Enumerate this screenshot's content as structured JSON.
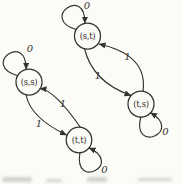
{
  "figure": {
    "type": "state-transition-diagram",
    "paper_color": "#fbfbf8",
    "ink_color": "#35322c",
    "smudge_color": "#b3b0aa",
    "states": [
      {
        "id": "st",
        "label": "(s,t)",
        "x": 87.5,
        "y": 36,
        "r": 13
      },
      {
        "id": "ss",
        "label": "(s,s)",
        "x": 29,
        "y": 82,
        "r": 13
      },
      {
        "id": "ts",
        "label": "(t,s)",
        "x": 141,
        "y": 104,
        "r": 13
      },
      {
        "id": "tt",
        "label": "(t,t)",
        "x": 79,
        "y": 140,
        "r": 12.8
      }
    ],
    "self_loops": [
      {
        "state": "st",
        "symbol": "0",
        "angle_deg": 234,
        "flip": false,
        "label_x": 87,
        "label_y": 9
      },
      {
        "state": "ss",
        "symbol": "0",
        "angle_deg": 233,
        "flip": false,
        "label_x": 30,
        "label_y": 52
      },
      {
        "state": "ts",
        "symbol": "0",
        "angle_deg": 67,
        "flip": true,
        "label_x": 165.5,
        "label_y": 135
      },
      {
        "state": "tt",
        "symbol": "0",
        "angle_deg": 62,
        "flip": true,
        "label_x": 104.5,
        "label_y": 172.5
      }
    ],
    "transitions": [
      {
        "from": "st",
        "to": "ts",
        "symbol": "1",
        "start": [
          84.5,
          48.5
        ],
        "control": [
          92.5,
          82
        ],
        "end": [
          131,
          95.5
        ],
        "label_x": 98,
        "label_y": 79
      },
      {
        "from": "ts",
        "to": "st",
        "symbol": "1",
        "start": [
          143,
          91
        ],
        "control": [
          148,
          55
        ],
        "end": [
          99,
          44
        ],
        "label_x": 127.5,
        "label_y": 60
      },
      {
        "from": "ss",
        "to": "tt",
        "symbol": "1",
        "start": [
          26,
          94.5
        ],
        "control": [
          30,
          117.5
        ],
        "end": [
          66.5,
          135
        ],
        "label_x": 39,
        "label_y": 127
      },
      {
        "from": "tt",
        "to": "ss",
        "symbol": "1",
        "start": [
          80.5,
          127.5
        ],
        "control": [
          54.5,
          90
        ],
        "end": [
          40,
          88.5
        ],
        "label_x": 63,
        "label_y": 106.5
      }
    ],
    "smudges": [
      {
        "x": 2,
        "y": 177,
        "w": 30,
        "h": 5
      },
      {
        "x": 46,
        "y": 179,
        "w": 16,
        "h": 3
      },
      {
        "x": 87,
        "y": 177,
        "w": 20,
        "h": 5
      },
      {
        "x": 138,
        "y": 178,
        "w": 34,
        "h": 3
      }
    ]
  }
}
